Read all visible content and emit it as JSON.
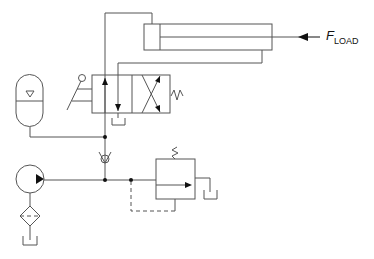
{
  "diagram": {
    "load_label": {
      "main": "F",
      "sub": "LOAD"
    },
    "components": [
      {
        "id": "cylinder",
        "name": "Double-acting hydraulic cylinder"
      },
      {
        "id": "dcv",
        "name": "4/2 directional control valve, lever-operated, spring return"
      },
      {
        "id": "accumulator",
        "name": "Hydraulic accumulator"
      },
      {
        "id": "check-valve",
        "name": "Check valve"
      },
      {
        "id": "pump",
        "name": "Fixed displacement pump"
      },
      {
        "id": "filter",
        "name": "Filter"
      },
      {
        "id": "relief-valve",
        "name": "Pressure relief valve"
      },
      {
        "id": "tank",
        "name": "Reservoir/tank"
      }
    ],
    "colors": {
      "line": "#555555",
      "junction": "#111111",
      "background": "#ffffff"
    }
  }
}
